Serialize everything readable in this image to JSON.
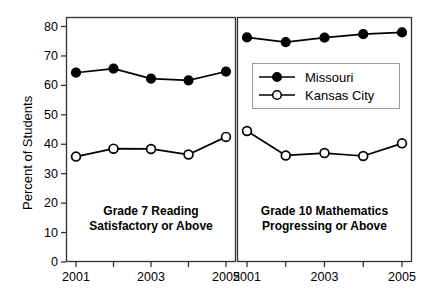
{
  "chart_data": {
    "type": "line",
    "title": "",
    "xlabel": "",
    "ylabel": "Percent of Students",
    "ylim": [
      0,
      85
    ],
    "yticks": [
      0,
      10,
      20,
      30,
      40,
      50,
      60,
      70,
      80
    ],
    "grid": false,
    "legend_position": "center-right-panel",
    "legend_entries": [
      "Missouri",
      "Kansas City"
    ],
    "x": [
      2001,
      2002,
      2003,
      2004,
      2005
    ],
    "xtick_labels": [
      "2001",
      "2003",
      "2005"
    ],
    "xticks": [
      2001,
      2003,
      2005
    ],
    "panels": [
      {
        "caption_line1": "Grade 7 Reading",
        "caption_line2": "Satisfactory or Above",
        "series": [
          {
            "name": "Missouri",
            "marker": "filled-circle",
            "values": [
              64.3,
              65.7,
              62.3,
              61.7,
              64.7
            ]
          },
          {
            "name": "Kansas City",
            "marker": "open-circle",
            "values": [
              35.8,
              38.5,
              38.4,
              36.5,
              42.5
            ]
          }
        ]
      },
      {
        "caption_line1": "Grade 10 Mathematics",
        "caption_line2": "Progressing or Above",
        "series": [
          {
            "name": "Missouri",
            "marker": "filled-circle",
            "values": [
              76.3,
              74.7,
              76.2,
              77.4,
              78.0
            ]
          },
          {
            "name": "Kansas City",
            "marker": "open-circle",
            "values": [
              44.5,
              36.2,
              37.0,
              36.0,
              40.3
            ]
          }
        ]
      }
    ],
    "colors": {
      "line": "#000000",
      "marker_fill_missouri": "#000000",
      "marker_fill_kansas_city": "#ffffff",
      "axis": "#333333",
      "legend_border": "#9a9a9a",
      "background": "#ffffff"
    }
  }
}
